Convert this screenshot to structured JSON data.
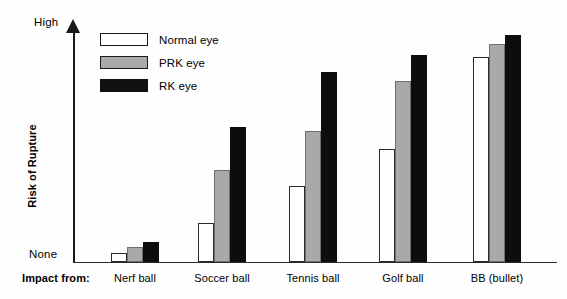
{
  "chart_data": {
    "type": "bar",
    "title": "",
    "xlabel": "Impact from:",
    "ylabel": "Risk of Rupture",
    "ylim": [
      0,
      100
    ],
    "ytick_labels": [
      "None",
      "High"
    ],
    "grid": false,
    "legend_position": "top-left",
    "categories": [
      "Nerf ball",
      "Soccer ball",
      "Tennis ball",
      "Golf ball",
      "BB (bullet)"
    ],
    "series": [
      {
        "name": "Normal eye",
        "color": "#ffffff",
        "values": [
          4,
          18,
          35,
          52,
          94
        ]
      },
      {
        "name": "PRK eye",
        "color": "#a9a9a9",
        "values": [
          7,
          42,
          60,
          83,
          100
        ]
      },
      {
        "name": "RK eye",
        "color": "#0d0d0d",
        "values": [
          9,
          62,
          87,
          95,
          104
        ]
      }
    ]
  },
  "axis": {
    "y_title": "Risk of Rupture",
    "y_top_label": "High",
    "y_bottom_label": "None",
    "x_prefix": "Impact from:"
  },
  "legend": {
    "items": [
      {
        "label": "Normal eye",
        "key": "normal"
      },
      {
        "label": "PRK eye",
        "key": "prk"
      },
      {
        "label": "RK eye",
        "key": "rk"
      }
    ]
  },
  "colors": {
    "normal_eye": "#ffffff",
    "prk_eye": "#a9a9a9",
    "rk_eye": "#0d0d0d",
    "axis": "#1a1a1a",
    "background": "#fefefe"
  }
}
